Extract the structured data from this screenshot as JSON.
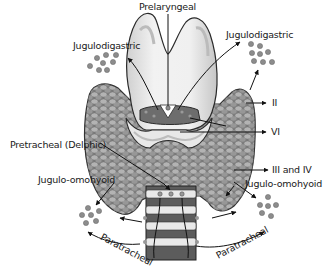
{
  "diagram": {
    "labels": {
      "prelaryngeal": "Prelaryngeal",
      "jugulodigastric_left": "Jugulodigastric",
      "jugulodigastric_right": "Jugulodigastric",
      "level_ii": "II",
      "level_vi": "VI",
      "pretracheal": "Pretracheal (Delphic)",
      "level_iii_iv": "III and IV",
      "jugulo_omohyoid_left": "Jugulo-omohyoid",
      "jugulo_omohyoid_right": "Jugulo-omohyoid",
      "paratracheal_left": "Paratracheal",
      "paratracheal_right": "Paratracheal"
    },
    "colors": {
      "thyroid_fill": "#8a8a8a",
      "thyroid_cells": "#b5b5b5",
      "cartilage_fill": "#e4e4e4",
      "cartilage_shade": "#c8c8c8",
      "outline": "#2a2a2a",
      "node_dot": "#8c8c8c",
      "text": "#1a1a1a"
    }
  }
}
